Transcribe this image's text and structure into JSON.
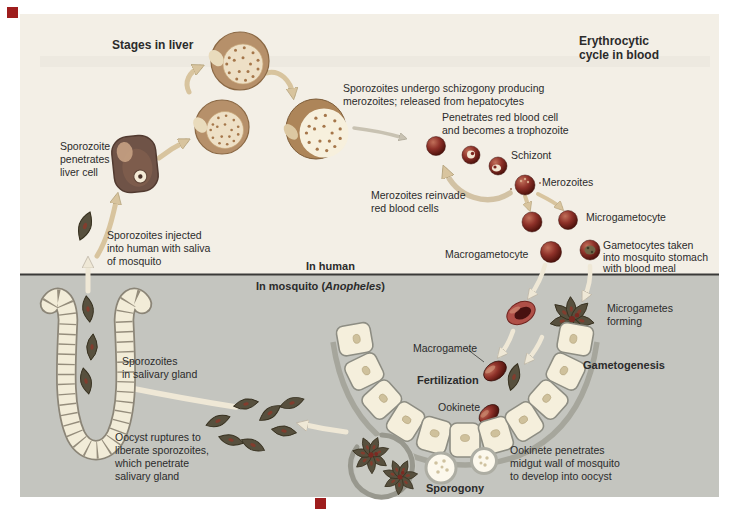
{
  "palette": {
    "human_region_bg": "#f3efe6",
    "mosquito_region_bg": "#c4c5bf",
    "divider": "#3a3a38",
    "marker_red": "#9e1d1d",
    "label_text": "#2b2b2b",
    "arrow_tan": "#d8c49e",
    "arrow_cream": "#efe8d6",
    "cell_cream": "#f4eedb",
    "parasite_olive": "#57503e",
    "rbc_maroon": "#8c322a"
  },
  "headers": {
    "stages_in_liver": "Stages in liver",
    "erythrocytic_line1": "Erythrocytic",
    "erythrocytic_line2": "cycle in blood",
    "in_human": "In human",
    "in_mosquito_pre": "In mosquito (",
    "in_mosquito_species": "Anopheles",
    "in_mosquito_post": ")"
  },
  "stage_labels": {
    "schizont": "Schizont",
    "merozoites": "Merozoites",
    "microgametocyte": "Microgametocyte",
    "macrogametocyte": "Macrogametocyte",
    "macrogamete": "Macrogamete",
    "fertilization": "Fertilization",
    "gametogenesis": "Gametogenesis",
    "ookinete": "Ookinete",
    "sporogony": "Sporogony"
  },
  "captions": {
    "sporozoites_undergo": [
      "Sporozoites undergo schizogony producing",
      "merozoites; released from hepatocytes"
    ],
    "penetrates_rbc": [
      "Penetrates red blood cell",
      "and becomes a trophozoite"
    ],
    "merozoites_reinvade": [
      "Merozoites reinvade",
      "red blood cells"
    ],
    "sporozoite_penetrates": [
      "Sporozoite",
      "penetrates",
      "liver cell"
    ],
    "sporozoites_injected": [
      "Sporozoites injected",
      "into human with saliva",
      "of mosquito"
    ],
    "gametocytes_taken": [
      "Gametocytes taken",
      "into mosquito stomach",
      "with blood meal"
    ],
    "microgametes_forming": [
      "Microgametes",
      "forming"
    ],
    "sporozoites_salivary": [
      "Sporozoites",
      "in salivary gland"
    ],
    "oocyst_ruptures": [
      "Oocyst ruptures to",
      "liberate sporozoites,",
      "which penetrate",
      "salivary gland"
    ],
    "ookinete_penetrates": [
      "Ookinete penetrates",
      "midgut wall of mosquito",
      "to develop into oocyst"
    ]
  }
}
